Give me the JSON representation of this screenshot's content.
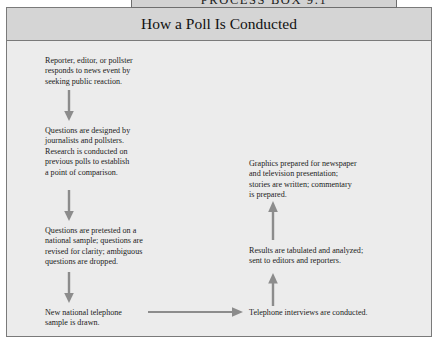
{
  "banner": {
    "label": "Process Box 9.1"
  },
  "header": {
    "title": "How a Poll Is Conducted"
  },
  "colors": {
    "banner_fill": "#d2d2d2",
    "header_fill": "#d5d5d5",
    "body_fill": "#ececec",
    "border": "#7a7a7a",
    "arrow": "#8c8c8c",
    "text": "#1b1b1b"
  },
  "flow": {
    "nodes": [
      {
        "id": "node-reporter-responds",
        "column": "left",
        "order": 1,
        "text": "Reporter, editor, or pollster\nresponds to news event by\nseeking public reaction."
      },
      {
        "id": "node-questions-designed",
        "column": "left",
        "order": 2,
        "text": "Questions are designed by\njournalists and pollsters.\nResearch is conducted on\nprevious polls to establish\na point of comparison."
      },
      {
        "id": "node-questions-pretested",
        "column": "left",
        "order": 3,
        "text": "Questions are pretested on a\nnational sample; questions are\nrevised for clarity; ambiguous\nquestions are dropped."
      },
      {
        "id": "node-sample-drawn",
        "column": "left",
        "order": 4,
        "text": "New national telephone\nsample is drawn."
      },
      {
        "id": "node-telephone-interviews",
        "column": "right",
        "order": 5,
        "text": "Telephone interviews are conducted."
      },
      {
        "id": "node-results-tabulated",
        "column": "right",
        "order": 6,
        "text": "Results are tabulated and analyzed;\nsent to editors and reporters."
      },
      {
        "id": "node-graphics-prepared",
        "column": "right",
        "order": 7,
        "text": "Graphics prepared for newspaper\nand television presentation;\nstories are written; commentary\nis prepared."
      }
    ],
    "connectors": [
      {
        "id": "connector-1",
        "direction": "down",
        "from": "node-reporter-responds",
        "to": "node-questions-designed"
      },
      {
        "id": "connector-2",
        "direction": "down",
        "from": "node-questions-designed",
        "to": "node-questions-pretested"
      },
      {
        "id": "connector-3",
        "direction": "down",
        "from": "node-questions-pretested",
        "to": "node-sample-drawn"
      },
      {
        "id": "connector-4",
        "direction": "right",
        "from": "node-sample-drawn",
        "to": "node-telephone-interviews"
      },
      {
        "id": "connector-5",
        "direction": "up",
        "from": "node-telephone-interviews",
        "to": "node-results-tabulated"
      },
      {
        "id": "connector-6",
        "direction": "up",
        "from": "node-results-tabulated",
        "to": "node-graphics-prepared"
      }
    ]
  }
}
